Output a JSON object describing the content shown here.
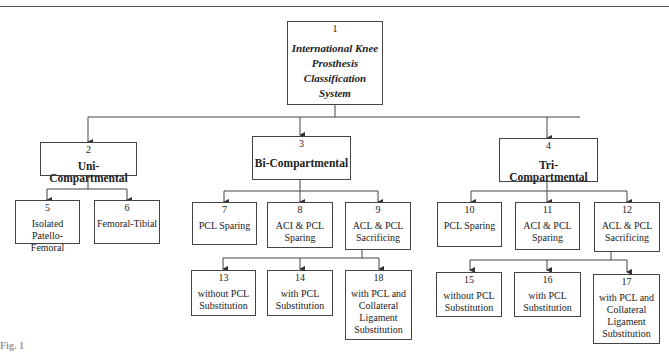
{
  "diagram": {
    "root": {
      "id": "1",
      "label": "International Knee Prosthesis Classification System"
    },
    "level1": [
      {
        "id": "2",
        "label": "Uni-Compartmental"
      },
      {
        "id": "3",
        "label": "Bi-Compartmental"
      },
      {
        "id": "4",
        "label": "Tri-Compartmental"
      }
    ],
    "uni_children": [
      {
        "id": "5",
        "label": "Isolated Patello-Femoral"
      },
      {
        "id": "6",
        "label": "Femoral-Tibial"
      }
    ],
    "bi_children": [
      {
        "id": "7",
        "label": "PCL Sparing"
      },
      {
        "id": "8",
        "label": "ACI & PCL Sparing"
      },
      {
        "id": "9",
        "label": "ACL & PCL Sacrificing"
      }
    ],
    "tri_children": [
      {
        "id": "10",
        "label": "PCL Sparing"
      },
      {
        "id": "11",
        "label": "ACI & PCL Sparing"
      },
      {
        "id": "12",
        "label": "ACL & PCL Sacrificing"
      }
    ],
    "bi_sacrificing_children": [
      {
        "id": "13",
        "label": "without PCL Substitution"
      },
      {
        "id": "14",
        "label": "with PCL Substitution"
      },
      {
        "id": "18",
        "label": "with PCL and Collateral Ligament Substitution"
      }
    ],
    "tri_sacrificing_children": [
      {
        "id": "15",
        "label": "without PCL Substitution"
      },
      {
        "id": "16",
        "label": "with PCL Substitution"
      },
      {
        "id": "17",
        "label": "with PCL and Collateral Ligament Substitution"
      }
    ]
  },
  "caption": "Fig. 1"
}
